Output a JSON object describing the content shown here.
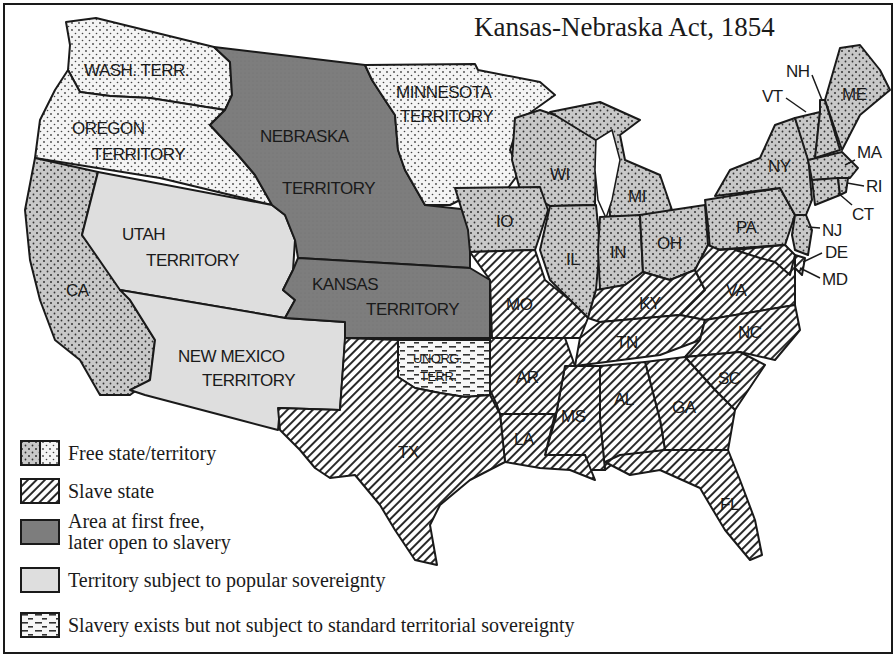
{
  "map": {
    "title": "Kansas-Nebraska Act, 1854",
    "colors": {
      "free_state": "#c8c8c8",
      "free_territory": "#efefef",
      "slave_hatch": "#2a2a2a",
      "nebraska_kansas": "#7d7d7d",
      "popular_sovereignty": "#dedede",
      "unorganized": "#f5f5f5",
      "border": "#1a1a1a",
      "background": "#ffffff"
    },
    "regions": {
      "wash_terr": "WASH. TERR.",
      "oregon_terr_line1": "OREGON",
      "oregon_terr_line2": "TERRITORY",
      "minnesota_terr_line1": "MINNESOTA",
      "minnesota_terr_line2": "TERRITORY",
      "nebraska_terr_line1": "NEBRASKA",
      "nebraska_terr_line2": "TERRITORY",
      "kansas_terr_line1": "KANSAS",
      "kansas_terr_line2": "TERRITORY",
      "utah_terr_line1": "UTAH",
      "utah_terr_line2": "TERRITORY",
      "new_mexico_terr_line1": "NEW MEXICO",
      "new_mexico_terr_line2": "TERRITORY",
      "unorg_terr_line1": "UNORG.",
      "unorg_terr_line2": "TERR."
    },
    "states": {
      "CA": "CA",
      "TX": "TX",
      "IO": "IO",
      "MO": "MO",
      "AR": "AR",
      "LA": "LA",
      "WI": "WI",
      "IL": "IL",
      "MI": "MI",
      "IN": "IN",
      "OH": "OH",
      "KY": "KY",
      "TN": "TN",
      "MS": "MS",
      "AL": "AL",
      "GA": "GA",
      "FL": "FL",
      "SC": "SC",
      "NC": "NC",
      "VA": "VA",
      "PA": "PA",
      "NY": "NY",
      "VT": "VT",
      "NH": "NH",
      "ME": "ME",
      "MA": "MA",
      "RI": "RI",
      "CT": "CT",
      "NJ": "NJ",
      "DE": "DE",
      "MD": "MD"
    },
    "region_categories": {
      "free": [
        "CA",
        "IO",
        "WI",
        "IL",
        "MI",
        "IN",
        "OH",
        "PA",
        "NY",
        "VT",
        "NH",
        "ME",
        "MA",
        "RI",
        "CT",
        "NJ",
        "Washington Territory",
        "Oregon Territory",
        "Minnesota Territory"
      ],
      "slave": [
        "TX",
        "MO",
        "AR",
        "LA",
        "KY",
        "TN",
        "MS",
        "AL",
        "GA",
        "FL",
        "SC",
        "NC",
        "VA",
        "DE",
        "MD"
      ],
      "first_free_later_open": [
        "Nebraska Territory",
        "Kansas Territory"
      ],
      "popular_sovereignty": [
        "Utah Territory",
        "New Mexico Territory"
      ],
      "unorganized": [
        "Unorganized Territory"
      ]
    }
  },
  "legend": {
    "items": [
      {
        "key": "free",
        "label": "Free state/territory"
      },
      {
        "key": "slave",
        "label": "Slave state"
      },
      {
        "key": "first_free",
        "label_line1": "Area at first free,",
        "label_line2": "later open to slavery"
      },
      {
        "key": "popular",
        "label": "Territory subject to popular sovereignty"
      },
      {
        "key": "unorganized",
        "label": "Slavery exists but not subject to standard territorial sovereignty"
      }
    ]
  }
}
